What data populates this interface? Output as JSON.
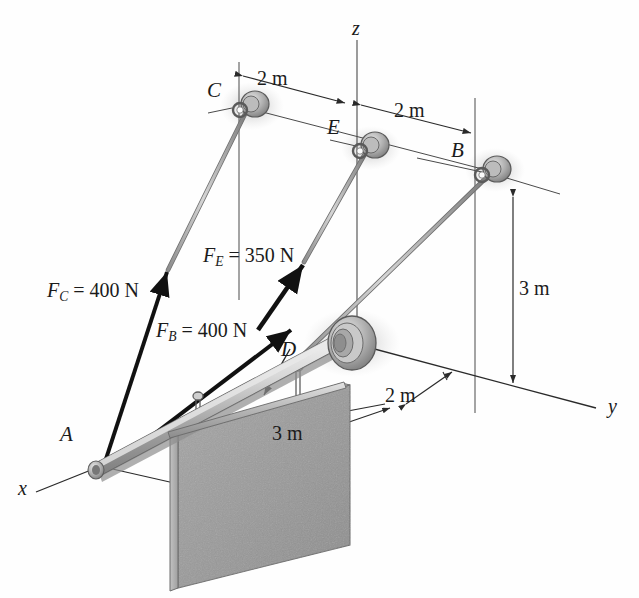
{
  "figure": {
    "type": "statics-free-body-diagram",
    "background_color": "#fefefe",
    "line_color": "#2a2a2a",
    "plate_fill": "#9a9a9a",
    "rod_fill": "#b9b9b9"
  },
  "axes": [
    {
      "name": "z-axis",
      "label": "z"
    },
    {
      "name": "y-axis",
      "label": "y"
    },
    {
      "name": "x-axis",
      "label": "x"
    }
  ],
  "points": [
    {
      "name": "point-c",
      "label": "C"
    },
    {
      "name": "point-e",
      "label": "E"
    },
    {
      "name": "point-b",
      "label": "B"
    },
    {
      "name": "point-d",
      "label": "D"
    },
    {
      "name": "point-a",
      "label": "A"
    }
  ],
  "forces": [
    {
      "name": "force-c",
      "symbol": "F",
      "subscript": "C",
      "value": "400",
      "unit": "N",
      "text": "F_C = 400 N"
    },
    {
      "name": "force-e",
      "symbol": "F",
      "subscript": "E",
      "value": "350",
      "unit": "N",
      "text": "F_E = 350 N"
    },
    {
      "name": "force-b",
      "symbol": "F",
      "subscript": "B",
      "value": "400",
      "unit": "N",
      "text": "F_B = 400 N"
    }
  ],
  "dimensions": [
    {
      "name": "dim-c-to-z",
      "label": "2 m"
    },
    {
      "name": "dim-z-to-b",
      "label": "2 m"
    },
    {
      "name": "dim-b-height",
      "label": "3 m"
    },
    {
      "name": "dim-plate-offset",
      "label": "2 m"
    },
    {
      "name": "dim-plate-width",
      "label": "3 m"
    }
  ],
  "labels": {
    "axis_z": "z",
    "axis_y": "y",
    "axis_x": "x",
    "point_c": "C",
    "point_e": "E",
    "point_b": "B",
    "point_d": "D",
    "point_a": "A",
    "force_c_sym": "F",
    "force_c_sub": "C",
    "force_c_rest": " = 400 N",
    "force_e_sym": "F",
    "force_e_sub": "E",
    "force_e_rest": " = 350 N",
    "force_b_sym": "F",
    "force_b_sub": "B",
    "force_b_rest": " = 400 N",
    "dim_2m_left": "2 m",
    "dim_2m_right": "2 m",
    "dim_3m_right": "3 m",
    "dim_2m_plate": "2 m",
    "dim_3m_plate": "3 m"
  }
}
